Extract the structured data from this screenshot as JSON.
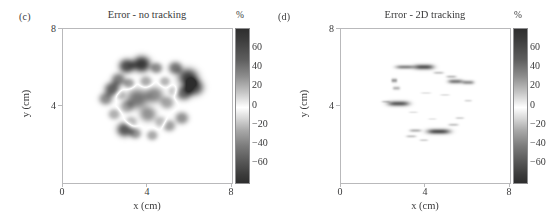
{
  "figure": {
    "panels": [
      {
        "id": "panel-c",
        "label": "(c)",
        "title": "Error - no tracking",
        "xlabel": "x (cm)",
        "ylabel": "y (cm)",
        "xticks": [
          "0",
          "4",
          "8"
        ],
        "yticks": [
          "8",
          "4"
        ],
        "colorbar_unit": "%",
        "colorbar_ticks": [
          "60",
          "40",
          "20",
          "0",
          "−20",
          "−40",
          "−60"
        ]
      },
      {
        "id": "panel-d",
        "label": "(d)",
        "title": "Error - 2D tracking",
        "xlabel": "x (cm)",
        "ylabel": "y (cm)",
        "xticks": [
          "0",
          "4",
          "8"
        ],
        "yticks": [
          "8",
          "4"
        ],
        "colorbar_unit": "%",
        "colorbar_ticks": [
          "60",
          "40",
          "20",
          "0",
          "−20",
          "−40",
          "−60"
        ]
      }
    ]
  },
  "chart_data": [
    {
      "type": "heatmap",
      "title": "Error - no tracking",
      "panel_label": "(c)",
      "xlabel": "x (cm)",
      "ylabel": "y (cm)",
      "xlim": [
        0,
        8
      ],
      "ylim": [
        0,
        8
      ],
      "xticks": [
        0,
        4,
        8
      ],
      "yticks": [
        4,
        8
      ],
      "colorbar": {
        "unit": "%",
        "ticks": [
          60,
          40,
          20,
          0,
          -20,
          -40,
          -60
        ],
        "vmin": -75,
        "vmax": 75,
        "colormap": "diverging-grayscale",
        "low_color": "#2e2e2e",
        "mid_color": "#ffffff",
        "high_color": "#2e2e2e"
      },
      "grid": false,
      "legend": "colorbar-right",
      "description": "Dense blocky reconstruction-error field filling a roughly circular phantom region centred near (4.0, 4.4) cm with radius about 2.4 cm. Strong positive and negative error patches up to +/-70 percent throughout the interior.",
      "blobs": [
        {
          "x": 3.0,
          "y": 6.1,
          "r": 0.4,
          "v": 62
        },
        {
          "x": 3.7,
          "y": 6.2,
          "r": 0.45,
          "v": 70
        },
        {
          "x": 4.4,
          "y": 6.0,
          "r": 0.3,
          "v": 40
        },
        {
          "x": 5.3,
          "y": 6.0,
          "r": 0.35,
          "v": 48
        },
        {
          "x": 5.9,
          "y": 5.5,
          "r": 0.5,
          "v": 66
        },
        {
          "x": 6.2,
          "y": 5.0,
          "r": 0.45,
          "v": 60
        },
        {
          "x": 5.7,
          "y": 4.7,
          "r": 0.4,
          "v": 52
        },
        {
          "x": 2.6,
          "y": 5.4,
          "r": 0.35,
          "v": 45
        },
        {
          "x": 2.3,
          "y": 4.9,
          "r": 0.38,
          "v": 55
        },
        {
          "x": 2.0,
          "y": 4.4,
          "r": 0.34,
          "v": 40
        },
        {
          "x": 3.1,
          "y": 5.2,
          "r": 0.28,
          "v": 34
        },
        {
          "x": 3.9,
          "y": 5.3,
          "r": 0.3,
          "v": 30
        },
        {
          "x": 4.8,
          "y": 5.3,
          "r": 0.26,
          "v": 26
        },
        {
          "x": 2.9,
          "y": 2.8,
          "r": 0.4,
          "v": 58
        },
        {
          "x": 3.4,
          "y": 2.6,
          "r": 0.3,
          "v": 36
        },
        {
          "x": 4.2,
          "y": 2.5,
          "r": 0.28,
          "v": 30
        },
        {
          "x": 5.0,
          "y": 3.0,
          "r": 0.32,
          "v": 34
        },
        {
          "x": 5.6,
          "y": 3.4,
          "r": 0.34,
          "v": 38
        },
        {
          "x": 2.4,
          "y": 3.6,
          "r": 0.3,
          "v": 28
        },
        {
          "x": 3.5,
          "y": 4.4,
          "r": 0.55,
          "v": -48
        },
        {
          "x": 4.3,
          "y": 4.6,
          "r": 0.45,
          "v": -40
        },
        {
          "x": 4.0,
          "y": 3.6,
          "r": 0.42,
          "v": -38
        },
        {
          "x": 3.0,
          "y": 4.0,
          "r": 0.35,
          "v": -30
        },
        {
          "x": 4.9,
          "y": 4.2,
          "r": 0.35,
          "v": -32
        },
        {
          "x": 3.2,
          "y": 3.2,
          "r": 0.3,
          "v": -26
        },
        {
          "x": 4.6,
          "y": 3.2,
          "r": 0.3,
          "v": -24
        },
        {
          "x": 2.7,
          "y": 4.6,
          "r": 0.26,
          "v": -22
        },
        {
          "x": 5.2,
          "y": 4.8,
          "r": 0.26,
          "v": -20
        }
      ]
    },
    {
      "type": "heatmap",
      "title": "Error - 2D tracking",
      "panel_label": "(d)",
      "xlabel": "x (cm)",
      "ylabel": "y (cm)",
      "xlim": [
        0,
        8
      ],
      "ylim": [
        0,
        8
      ],
      "xticks": [
        0,
        4,
        8
      ],
      "yticks": [
        4,
        8
      ],
      "colorbar": {
        "unit": "%",
        "ticks": [
          60,
          40,
          20,
          0,
          -20,
          -40,
          -60
        ],
        "vmin": -75,
        "vmax": 75,
        "colormap": "diverging-grayscale",
        "low_color": "#2e2e2e",
        "mid_color": "#ffffff",
        "high_color": "#2e2e2e"
      },
      "grid": false,
      "legend": "colorbar-right",
      "description": "Sparse residual error: mostly white (near zero) with a few short horizontal dark streaks arranged around the boundary of the same circular phantom region, indicating much lower error when 2D tracking is applied.",
      "streaks": [
        {
          "x": 3.0,
          "y": 6.05,
          "w": 0.55,
          "h": 0.1,
          "v": 40
        },
        {
          "x": 3.9,
          "y": 6.05,
          "w": 0.6,
          "h": 0.13,
          "v": 58
        },
        {
          "x": 4.6,
          "y": 5.75,
          "w": 0.3,
          "h": 0.07,
          "v": 18
        },
        {
          "x": 5.4,
          "y": 5.3,
          "w": 0.45,
          "h": 0.11,
          "v": 44
        },
        {
          "x": 6.0,
          "y": 5.25,
          "w": 0.35,
          "h": 0.1,
          "v": 36
        },
        {
          "x": 5.2,
          "y": 5.55,
          "w": 0.3,
          "h": 0.07,
          "v": 20
        },
        {
          "x": 2.5,
          "y": 5.35,
          "w": 0.18,
          "h": 0.1,
          "v": 34
        },
        {
          "x": 2.6,
          "y": 4.95,
          "w": 0.22,
          "h": 0.09,
          "v": 24
        },
        {
          "x": 2.7,
          "y": 4.15,
          "w": 0.65,
          "h": 0.13,
          "v": 56
        },
        {
          "x": 2.1,
          "y": 4.25,
          "w": 0.25,
          "h": 0.06,
          "v": 16
        },
        {
          "x": 4.6,
          "y": 2.7,
          "w": 0.7,
          "h": 0.13,
          "v": 60
        },
        {
          "x": 3.5,
          "y": 2.75,
          "w": 0.35,
          "h": 0.08,
          "v": 24
        },
        {
          "x": 3.3,
          "y": 2.45,
          "w": 0.3,
          "h": 0.07,
          "v": 18
        },
        {
          "x": 3.9,
          "y": 2.25,
          "w": 0.25,
          "h": 0.06,
          "v": 14
        },
        {
          "x": 5.3,
          "y": 3.05,
          "w": 0.3,
          "h": 0.07,
          "v": 18
        },
        {
          "x": 5.6,
          "y": 3.4,
          "w": 0.25,
          "h": 0.06,
          "v": 14
        },
        {
          "x": 6.0,
          "y": 4.3,
          "w": 0.22,
          "h": 0.06,
          "v": 12
        },
        {
          "x": 4.9,
          "y": 4.6,
          "w": 0.28,
          "h": 0.05,
          "v": 10
        },
        {
          "x": 4.0,
          "y": 4.7,
          "w": 0.3,
          "h": 0.05,
          "v": 9
        },
        {
          "x": 3.4,
          "y": 3.7,
          "w": 0.26,
          "h": 0.05,
          "v": 9
        },
        {
          "x": 4.3,
          "y": 3.35,
          "w": 0.24,
          "h": 0.05,
          "v": 8
        }
      ]
    }
  ]
}
